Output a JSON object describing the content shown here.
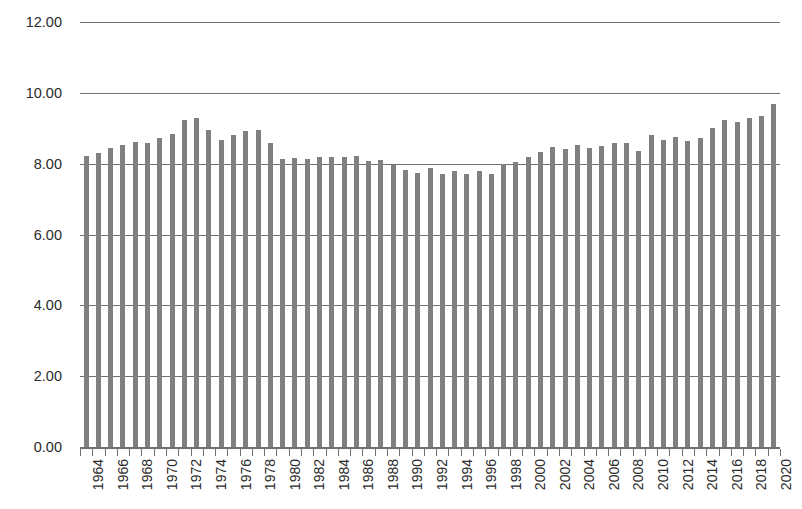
{
  "chart_data": {
    "type": "bar",
    "title": "",
    "subtitle": "",
    "xlabel": "",
    "ylabel": "",
    "ylim": [
      0.0,
      12.0
    ],
    "y_tick_labels": [
      "0.00",
      "2.00",
      "4.00",
      "6.00",
      "8.00",
      "10.00",
      "12.00"
    ],
    "y_tick_values": [
      0.0,
      2.0,
      4.0,
      6.0,
      8.0,
      10.0,
      12.0
    ],
    "grid": true,
    "legend": false,
    "legend_position": "none",
    "x_tick_label_rotation": 90,
    "x_tick_label_interval": 2,
    "bar_color": "#808080",
    "gridline_color": "#6f6f6f",
    "text_color": "#2b2b2b",
    "categories": [
      "1964",
      "1965",
      "1966",
      "1967",
      "1968",
      "1969",
      "1970",
      "1971",
      "1972",
      "1973",
      "1974",
      "1975",
      "1976",
      "1977",
      "1978",
      "1979",
      "1980",
      "1981",
      "1982",
      "1983",
      "1984",
      "1985",
      "1986",
      "1987",
      "1988",
      "1989",
      "1990",
      "1991",
      "1992",
      "1993",
      "1994",
      "1995",
      "1996",
      "1997",
      "1998",
      "1999",
      "2000",
      "2001",
      "2002",
      "2003",
      "2004",
      "2005",
      "2006",
      "2007",
      "2008",
      "2009",
      "2010",
      "2011",
      "2012",
      "2013",
      "2014",
      "2015",
      "2016",
      "2017",
      "2018",
      "2019",
      "2020"
    ],
    "visible_tick_labels": [
      "1964",
      "1966",
      "1968",
      "1970",
      "1972",
      "1974",
      "1976",
      "1978",
      "1980",
      "1982",
      "1984",
      "1986",
      "1988",
      "1990",
      "1992",
      "1994",
      "1996",
      "1998",
      "2000",
      "2002",
      "2004",
      "2006",
      "2008",
      "2010",
      "2012",
      "2014",
      "2016",
      "2018",
      "2020"
    ],
    "values": [
      8.22,
      8.3,
      8.45,
      8.52,
      8.62,
      8.58,
      8.72,
      8.85,
      9.22,
      9.28,
      8.95,
      8.68,
      8.8,
      8.92,
      8.95,
      8.58,
      8.12,
      8.15,
      8.12,
      8.18,
      8.2,
      8.18,
      8.22,
      8.08,
      8.1,
      7.95,
      7.82,
      7.75,
      7.88,
      7.72,
      7.78,
      7.72,
      7.78,
      7.72,
      7.98,
      8.05,
      8.2,
      8.32,
      8.48,
      8.42,
      8.52,
      8.45,
      8.5,
      8.58,
      8.58,
      8.35,
      8.8,
      8.68,
      8.75,
      8.65,
      8.72,
      9.0,
      9.22,
      9.18,
      9.28,
      9.35,
      9.68
    ]
  }
}
